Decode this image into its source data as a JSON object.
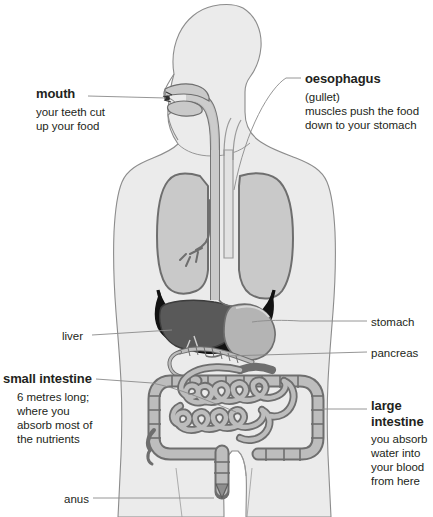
{
  "diagram": {
    "colors": {
      "background": "#ffffff",
      "body_fill": "#ebebeb",
      "body_outline": "#8c8c8c",
      "organ_light": "#c9c9c9",
      "organ_mid": "#b0b0b0",
      "organ_outline": "#6e6e6e",
      "liver_dark": "#595959",
      "diaphragm_dark": "#1a1a1a",
      "text": "#231f20",
      "leader_line": "#8a8a8a"
    }
  },
  "labels": {
    "mouth": {
      "title": "mouth",
      "description": "your teeth cut\nup your food",
      "desc_lines": [
        "your teeth cut",
        "up your food"
      ]
    },
    "oesophagus": {
      "title": "oesophagus",
      "desc_lines": [
        "(gullet)",
        "muscles push the food",
        "down to your stomach"
      ]
    },
    "liver": {
      "title": "liver"
    },
    "stomach": {
      "title": "stomach"
    },
    "pancreas": {
      "title": "pancreas"
    },
    "small_intestine": {
      "title": "small intestine",
      "desc_lines": [
        "6 metres long;",
        "where you",
        "absorb most of",
        "the nutrients"
      ]
    },
    "large_intestine": {
      "title": "large\nintestine",
      "title_lines": [
        "large",
        "intestine"
      ],
      "desc_lines": [
        "you absorb",
        "water into",
        "your blood",
        "from here"
      ]
    },
    "anus": {
      "title": "anus"
    }
  },
  "organs": [
    {
      "name": "mouth"
    },
    {
      "name": "oesophagus"
    },
    {
      "name": "lungs"
    },
    {
      "name": "diaphragm"
    },
    {
      "name": "liver"
    },
    {
      "name": "stomach"
    },
    {
      "name": "pancreas"
    },
    {
      "name": "small-intestine"
    },
    {
      "name": "large-intestine"
    },
    {
      "name": "rectum"
    },
    {
      "name": "anus"
    }
  ]
}
